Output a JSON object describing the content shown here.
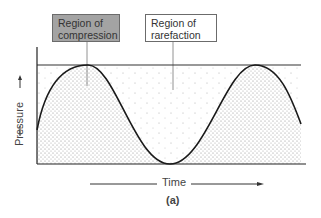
{
  "diagram": {
    "labels": {
      "compression": "Region of compression",
      "rarefaction": "Region of rarefaction"
    },
    "axes": {
      "y_label": "Pressure",
      "x_label": "Time"
    },
    "figure_tag": "(a)",
    "colors": {
      "compression_box_fill": "#a3a3a3",
      "rarefaction_box_fill": "#ffffff",
      "curve": "#1a1a1a",
      "stipple": "#8a8a8a"
    }
  }
}
